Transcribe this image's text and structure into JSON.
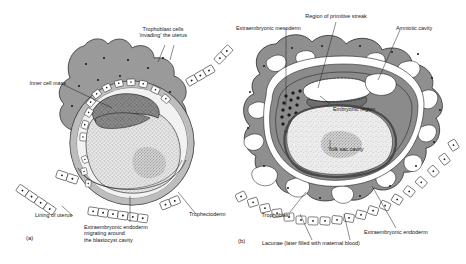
{
  "figure": {
    "panels": [
      {
        "id": "(a)",
        "name": "early-implantation",
        "labels": [
          {
            "key": "trophoblast_invading",
            "text": "Trophoblast cells\n‘invading’ the uterus"
          },
          {
            "key": "inner_cell_mass",
            "text": "Inner cell mass"
          },
          {
            "key": "lining_of_uterus",
            "text": "Lining of uterus"
          },
          {
            "key": "trophectoderm",
            "text": "Trophectoderm"
          },
          {
            "key": "extraembryonic_endoderm",
            "text": "Extraembryonic endoderm\nmigrating around\nthe blastocyst cavity"
          }
        ]
      },
      {
        "id": "(b)",
        "name": "later-implantation",
        "labels": [
          {
            "key": "region_primitive_streak",
            "text": "Region of primitive streak"
          },
          {
            "key": "extraembryonic_mesoderm",
            "text": "Extraembryonic mesoderm"
          },
          {
            "key": "amniotic_cavity",
            "text": "Amniotic cavity"
          },
          {
            "key": "embryonic_region",
            "text": "Embryonic region"
          },
          {
            "key": "yolk_sac_cavity",
            "text": "Yolk sac cavity"
          },
          {
            "key": "trophoblast",
            "text": "Trophoblast"
          },
          {
            "key": "extraembryonic_endoderm_b",
            "text": "Extraembryonic endoderm"
          },
          {
            "key": "lacunae",
            "text": "Lacunae (later filled with maternal blood)"
          }
        ]
      }
    ],
    "colors": {
      "background": "#ffffff",
      "ink": "#151515",
      "trophoblast_gray": "#9a9a9a",
      "inner_cell_mass_gray": "#8b8b8b",
      "endoderm_dark": "#6f6f6f",
      "yolk_sac_light": "#dddddd",
      "cavity_white": "#ffffff",
      "stipple": "#4a4a4a"
    }
  }
}
